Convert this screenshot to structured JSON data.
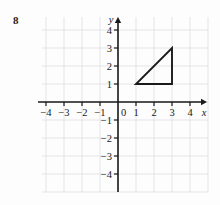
{
  "problem": {
    "number": "8"
  },
  "chart_data": {
    "type": "scatter",
    "title": "",
    "xlabel": "x",
    "ylabel": "y",
    "xlim": [
      -4.6,
      4.6
    ],
    "ylim": [
      -4.6,
      4.6
    ],
    "grid": true,
    "legend": null,
    "origin_label": "0",
    "x_ticks": [
      -4,
      -3,
      -2,
      -1,
      1,
      2,
      3,
      4
    ],
    "y_ticks": [
      4,
      3,
      2,
      1,
      -1,
      -2,
      -3,
      -4
    ],
    "x_tick_labels": [
      "−4",
      "−3",
      "−2",
      "−1",
      "1",
      "2",
      "3",
      "4"
    ],
    "y_tick_labels": [
      "4",
      "3",
      "2",
      "1",
      "−1",
      "−2",
      "−3",
      "−4"
    ],
    "shapes": [
      {
        "name": "triangle",
        "kind": "polygon",
        "closed": true,
        "points": [
          [
            1,
            1
          ],
          [
            3,
            1
          ],
          [
            3,
            3
          ]
        ],
        "stroke": "#1a1a1a",
        "fill": "none"
      }
    ]
  },
  "colors": {
    "axis": "#1a1a1a",
    "grid": "#e2e2e6",
    "shape_stroke": "#1a1a1a",
    "text": "#1a1a1a",
    "background": "#fdfdfd"
  },
  "geometry": {
    "origin_px": [
      118,
      102
    ],
    "unit_px": 18,
    "grid_left_px": 42,
    "grid_right_px": 208,
    "grid_top_px": 17,
    "grid_bottom_px": 192
  }
}
